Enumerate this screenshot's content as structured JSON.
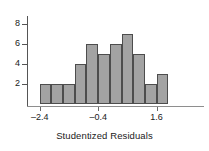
{
  "chart_data": {
    "type": "bar",
    "title": "",
    "subtitle": "",
    "xlabel": "Studentized Residuals",
    "ylabel": "",
    "grid": false,
    "legend": false,
    "bin_width": 0.4,
    "bin_starts": [
      -2.4,
      -2.0,
      -1.6,
      -1.2,
      -0.8,
      -0.4,
      0.0,
      0.4,
      0.8,
      1.2,
      1.6
    ],
    "categories": [
      "-2.4 to -2.0",
      "-2.0 to -1.6",
      "-1.6 to -1.2",
      "-1.2 to -0.8",
      "-0.8 to -0.4",
      "-0.4 to 0.0",
      "0.0 to 0.4",
      "0.4 to 0.8",
      "0.8 to 1.2",
      "1.2 to 1.6",
      "1.6 to 2.0"
    ],
    "values": [
      2,
      2,
      2,
      4,
      6,
      5,
      6,
      7,
      5,
      2,
      3
    ],
    "xlim": [
      -2.8,
      2.4
    ],
    "ylim": [
      0,
      8.6
    ],
    "xticks": [
      -2.4,
      -0.4,
      1.6
    ],
    "xtick_labels": [
      "–2.4",
      "–0.4",
      "1.6"
    ],
    "yticks": [
      2,
      4,
      6,
      8
    ],
    "ytick_labels": [
      "2",
      "4",
      "6",
      "8"
    ],
    "bar_color": "#a3a3a3",
    "bar_edge_color": "#4d4d4d",
    "axis_color": "#555555",
    "text_color": "#1a1a1a"
  }
}
